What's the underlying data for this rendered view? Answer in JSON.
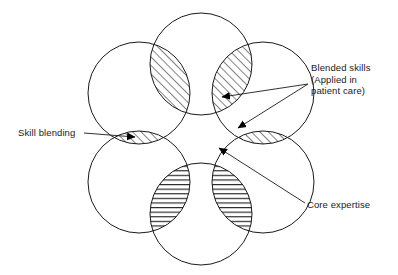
{
  "diagram": {
    "stroke_color": "#1a1a1a",
    "hatch_color": "#1a1a1a",
    "background_color": "#ffffff",
    "circles": [
      {
        "name": "top-circle",
        "cx": 201,
        "cy": 64,
        "r": 51
      },
      {
        "name": "upper-left-circle",
        "cx": 139,
        "cy": 93,
        "r": 51
      },
      {
        "name": "upper-right-circle",
        "cx": 263,
        "cy": 93,
        "r": 51
      },
      {
        "name": "lower-left-circle",
        "cx": 139,
        "cy": 182,
        "r": 51
      },
      {
        "name": "lower-right-circle",
        "cx": 263,
        "cy": 182,
        "r": 51
      },
      {
        "name": "bottom-circle",
        "cx": 201,
        "cy": 214,
        "r": 51
      }
    ],
    "lenses": [
      {
        "name": "lens-top-left",
        "a": "top-circle",
        "b": "upper-left-circle",
        "hatch": "diagonal"
      },
      {
        "name": "lens-top-right",
        "a": "top-circle",
        "b": "upper-right-circle",
        "hatch": "diagonal"
      },
      {
        "name": "lens-left",
        "a": "upper-left-circle",
        "b": "lower-left-circle",
        "hatch": "diagonal"
      },
      {
        "name": "lens-right",
        "a": "upper-right-circle",
        "b": "lower-right-circle",
        "hatch": "diagonal"
      },
      {
        "name": "lens-bottom-left",
        "a": "lower-left-circle",
        "b": "bottom-circle",
        "hatch": "horizontal"
      },
      {
        "name": "lens-bottom-right",
        "a": "lower-right-circle",
        "b": "bottom-circle",
        "hatch": "horizontal"
      }
    ]
  },
  "labels": {
    "blended_skills": {
      "line1": "Blended skills",
      "line2": "(Applied in",
      "line3": "patient care)"
    },
    "skill_blending": "Skill blending",
    "core_expertise": "Core expertise"
  }
}
